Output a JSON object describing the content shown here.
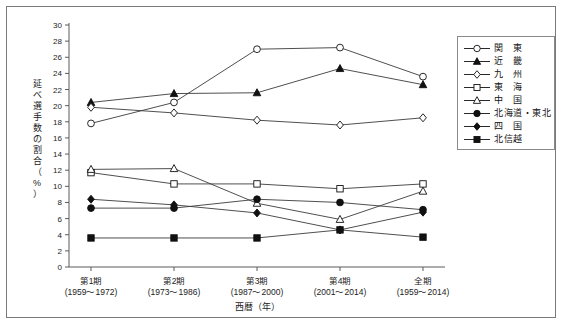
{
  "chart_data": {
    "type": "line",
    "title": "",
    "xlabel": "西暦（年）",
    "ylabel": "延べ選手数の割合（%）",
    "ylim": [
      0,
      30
    ],
    "ytick_step": 2,
    "yticks": [
      "0",
      "2",
      "4",
      "6",
      "8",
      "10",
      "12",
      "14",
      "16",
      "18",
      "20",
      "22",
      "24",
      "26",
      "28",
      "30"
    ],
    "grid": false,
    "legend_position": "right-top",
    "categories": [
      "第1期",
      "第2期",
      "第3期",
      "第4期",
      "全期"
    ],
    "category_sublabels": [
      "(1959～1972)",
      "(1973～1986)",
      "(1987～2000)",
      "(2001～2014)",
      "(1959～2014)"
    ],
    "series": [
      {
        "name": "関　東",
        "marker": "open-circle",
        "values": [
          17.8,
          20.4,
          27.0,
          27.2,
          23.6
        ]
      },
      {
        "name": "近　畿",
        "marker": "filled-triangle",
        "values": [
          20.4,
          21.5,
          21.6,
          24.6,
          22.6
        ]
      },
      {
        "name": "九　州",
        "marker": "open-diamond",
        "values": [
          19.8,
          19.1,
          18.2,
          17.6,
          18.5
        ]
      },
      {
        "name": "東　海",
        "marker": "open-square",
        "values": [
          11.7,
          10.3,
          10.3,
          9.7,
          10.3
        ]
      },
      {
        "name": "中　国",
        "marker": "open-triangle",
        "values": [
          12.1,
          12.2,
          7.9,
          5.9,
          9.4
        ]
      },
      {
        "name": "北海道・東北",
        "marker": "filled-circle",
        "values": [
          7.3,
          7.3,
          8.4,
          8.0,
          7.1
        ]
      },
      {
        "name": "四　国",
        "marker": "filled-diamond",
        "values": [
          8.4,
          7.7,
          6.7,
          4.6,
          6.8
        ]
      },
      {
        "name": "北信越",
        "marker": "filled-square",
        "values": [
          3.6,
          3.6,
          3.6,
          4.6,
          3.7
        ]
      }
    ]
  },
  "legend": {
    "items": [
      {
        "label": "関　東"
      },
      {
        "label": "近　畿"
      },
      {
        "label": "九　州"
      },
      {
        "label": "東　海"
      },
      {
        "label": "中　国"
      },
      {
        "label": "北海道・東北"
      },
      {
        "label": "四　国"
      },
      {
        "label": "北信越"
      }
    ]
  },
  "axis": {
    "y_title_chars": [
      "延",
      "べ",
      "選",
      "手",
      "数",
      "の",
      "割",
      "合",
      "（",
      "%",
      "）"
    ],
    "x_title": "西暦（年）"
  }
}
